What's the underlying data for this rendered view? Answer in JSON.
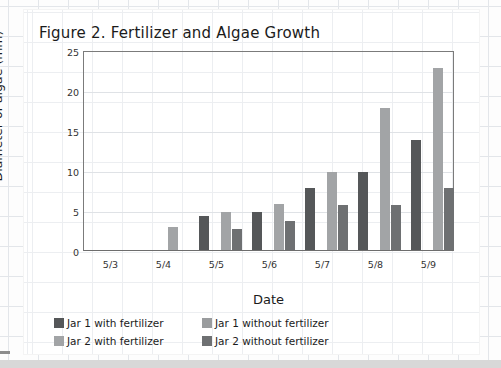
{
  "figure": {
    "title": "Figure 2. Fertilizer and Algae Growth"
  },
  "chart_data": {
    "type": "bar",
    "title": "Figure 2. Fertilizer and Algae Growth",
    "xlabel": "Date",
    "ylabel": "Diameter of algae (mm)",
    "categories": [
      "5/3",
      "5/4",
      "5/5",
      "5/6",
      "5/7",
      "5/8",
      "5/9"
    ],
    "ylim": [
      0,
      25
    ],
    "yticks": [
      0,
      5,
      10,
      15,
      20,
      25
    ],
    "grid": true,
    "legend_position": "bottom-left",
    "series": [
      {
        "name": "Jar 1 with fertilizer",
        "color": "#555759",
        "values": [
          0,
          0,
          4.3,
          4.7,
          7.8,
          9.7,
          13.7
        ]
      },
      {
        "name": "Jar 1 without fertilizer",
        "color": "#9a9c9e",
        "values": [
          0,
          0,
          0,
          0,
          0,
          0,
          0
        ]
      },
      {
        "name": "Jar 2 with fertilizer",
        "color": "#a2a4a6",
        "values": [
          0,
          2.9,
          4.7,
          5.8,
          9.7,
          17.7,
          22.7
        ]
      },
      {
        "name": "Jar 2 without fertilizer",
        "color": "#6e7072",
        "values": [
          0,
          0,
          2.6,
          3.6,
          5.6,
          5.6,
          7.7
        ]
      }
    ]
  }
}
